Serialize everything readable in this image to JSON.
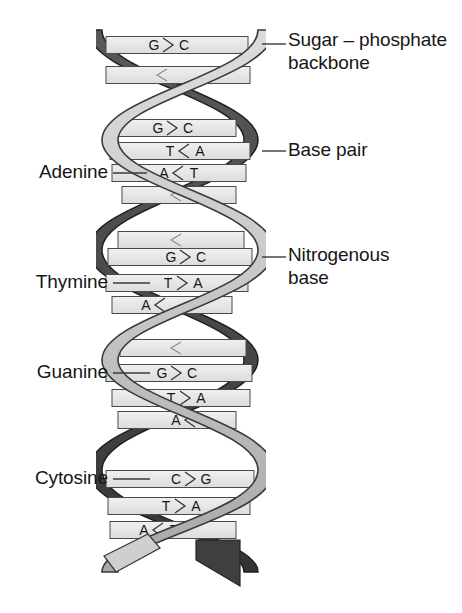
{
  "figure": {
    "colors": {
      "ribbon_front": "#c9c9c9",
      "ribbon_back": "#4a4a4a",
      "rung_fill": "#e8e8e8",
      "outline": "#2b2b2b",
      "text": "#161616",
      "leader": "#3a3a3a",
      "background": "#ffffff"
    }
  },
  "callouts": {
    "right": [
      {
        "id": "sugar-phosphate-backbone",
        "text": "Sugar – phosphate\nbackbone",
        "x": 288,
        "y": 28,
        "leader": {
          "x1": 262,
          "y1": 44,
          "x2": 286,
          "y2": 44
        }
      },
      {
        "id": "base-pair",
        "text": "Base pair",
        "x": 288,
        "y": 138,
        "leader": {
          "x1": 262,
          "y1": 151,
          "x2": 286,
          "y2": 151
        }
      },
      {
        "id": "nitrogenous-base",
        "text": "Nitrogenous\nbase",
        "x": 288,
        "y": 243,
        "leader": {
          "x1": 262,
          "y1": 257,
          "x2": 286,
          "y2": 257
        }
      }
    ],
    "left": [
      {
        "id": "adenine",
        "text": "Adenine",
        "x": 18,
        "y": 160,
        "width": 90,
        "leader": {
          "x1": 113,
          "y1": 173,
          "x2": 147,
          "y2": 173
        }
      },
      {
        "id": "thymine",
        "text": "Thymine",
        "x": 18,
        "y": 270,
        "width": 90,
        "leader": {
          "x1": 113,
          "y1": 283,
          "x2": 150,
          "y2": 283
        }
      },
      {
        "id": "guanine",
        "text": "Guanine",
        "x": 18,
        "y": 360,
        "width": 90,
        "leader": {
          "x1": 113,
          "y1": 373,
          "x2": 150,
          "y2": 373
        }
      },
      {
        "id": "cytosine",
        "text": "Cytosine",
        "x": 18,
        "y": 466,
        "width": 90,
        "leader": {
          "x1": 113,
          "y1": 479,
          "x2": 150,
          "y2": 479
        }
      }
    ]
  },
  "base_pairs": [
    {
      "id": "bp-1",
      "left": "G",
      "right": "C",
      "pairing": ">",
      "y": 45,
      "x1": 106,
      "x2": 248,
      "label_x": 168,
      "show": true
    },
    {
      "id": "bp-2",
      "left": "",
      "right": "",
      "pairing": "<",
      "y": 75,
      "x1": 106,
      "x2": 250,
      "label_x": 162,
      "show": false
    },
    {
      "id": "bp-3",
      "left": "G",
      "right": "C",
      "pairing": ">",
      "y": 128,
      "x1": 118,
      "x2": 236,
      "label_x": 172,
      "show": true
    },
    {
      "id": "bp-4",
      "left": "T",
      "right": "A",
      "pairing": "<",
      "y": 151,
      "x1": 110,
      "x2": 250,
      "label_x": 184,
      "show": true
    },
    {
      "id": "bp-5",
      "left": "A",
      "right": "T",
      "pairing": "<",
      "y": 173,
      "x1": 112,
      "x2": 246,
      "label_x": 178,
      "show": true
    },
    {
      "id": "bp-6",
      "left": "",
      "right": "",
      "pairing": "",
      "y": 195,
      "x1": 122,
      "x2": 236,
      "label_x": 176,
      "show": false
    },
    {
      "id": "bp-7",
      "left": "",
      "right": "",
      "pairing": "",
      "y": 240,
      "x1": 118,
      "x2": 244,
      "label_x": 176,
      "show": false
    },
    {
      "id": "bp-8",
      "left": "G",
      "right": "C",
      "pairing": ">",
      "y": 257,
      "x1": 108,
      "x2": 252,
      "label_x": 185,
      "show": true
    },
    {
      "id": "bp-9",
      "left": "T",
      "right": "A",
      "pairing": ">",
      "y": 283,
      "x1": 106,
      "x2": 248,
      "label_x": 182,
      "show": true
    },
    {
      "id": "bp-10",
      "left": "A",
      "right": "",
      "pairing": "<",
      "y": 305,
      "x1": 112,
      "x2": 232,
      "label_x": 160,
      "show": true
    },
    {
      "id": "bp-11",
      "left": "",
      "right": "",
      "pairing": "",
      "y": 348,
      "x1": 120,
      "x2": 246,
      "label_x": 176,
      "show": false
    },
    {
      "id": "bp-12",
      "left": "G",
      "right": "C",
      "pairing": ">",
      "y": 373,
      "x1": 106,
      "x2": 252,
      "label_x": 176,
      "show": true
    },
    {
      "id": "bp-13",
      "left": "T",
      "right": "A",
      "pairing": ">",
      "y": 398,
      "x1": 112,
      "x2": 250,
      "label_x": 185,
      "show": true
    },
    {
      "id": "bp-14",
      "left": "A",
      "right": "",
      "pairing": "<",
      "y": 420,
      "x1": 118,
      "x2": 236,
      "label_x": 190,
      "show": true
    },
    {
      "id": "bp-15",
      "left": "C",
      "right": "G",
      "pairing": ">",
      "y": 479,
      "x1": 106,
      "x2": 254,
      "label_x": 190,
      "show": true
    },
    {
      "id": "bp-16",
      "left": "T",
      "right": "A",
      "pairing": ">",
      "y": 506,
      "x1": 108,
      "x2": 250,
      "label_x": 180,
      "show": true
    },
    {
      "id": "bp-17",
      "left": "A",
      "right": "T",
      "pairing": "<",
      "y": 530,
      "x1": 110,
      "x2": 236,
      "label_x": 158,
      "show": true
    }
  ],
  "helix": {
    "strand_a_name": "sugar-phosphate-strand-front",
    "strand_b_name": "sugar-phosphate-strand-back",
    "turns": 3,
    "top_y": 28,
    "bottom_y": 570,
    "center_x": 180,
    "amplitude": 78
  }
}
